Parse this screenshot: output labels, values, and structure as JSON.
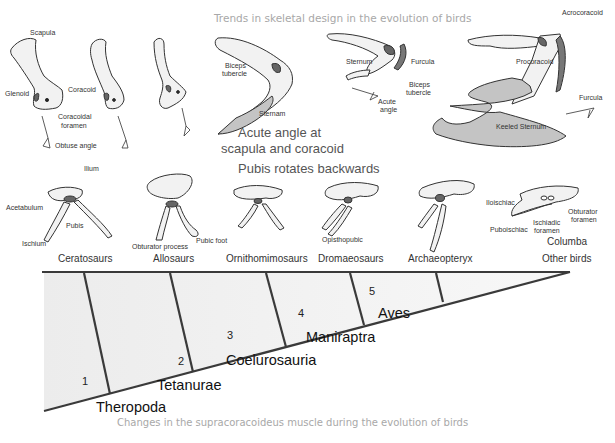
{
  "top_title": "Trends in skeletal design in the evolution of birds",
  "pectoral": {
    "labels": {
      "scapula": "Scapula",
      "glenoid": "Glenoid",
      "coracoid": "Coracoid",
      "coracoidal_foramen_1": "Coracoidal",
      "coracoidal_foramen_2": "foramen",
      "obtuse_angle": "Obtuse angle",
      "biceps_tubercle_1": "Biceps",
      "biceps_tubercle_2": "tubercle",
      "sternam": "Sternam",
      "acute_caption_1": "Acute angle at",
      "acute_caption_2": "scapula and coracoid",
      "sternum": "Sternum",
      "furcula": "Furcula",
      "biceps_tubercle_b1": "Biceps",
      "biceps_tubercle_b2": "tubercle",
      "acute_angle_1": "Acute",
      "acute_angle_2": "angle",
      "acrocoracoid": "Acrocoracoid",
      "procoracoid": "Procoracoid",
      "furcula_2": "Furcula",
      "keeled_sternum": "Keeled Sternum"
    }
  },
  "pelvis": {
    "heading": "Pubis rotates backwards",
    "labels": {
      "ilium": "Ilium",
      "acetabulum": "Acetabulum",
      "pubis": "Pubis",
      "ischium": "Ischium",
      "obturator_process": "Obturator process",
      "pubic_foot": "Pubic foot",
      "opisthopubic": "Opisthopubic",
      "iloischiac": "Iloischiac",
      "puboischiac": "Puboischiac",
      "ischiadic_foramen_1": "Ischiadic",
      "ischiadic_foramen_2": "foramen",
      "obturator_foramen_1": "Obturator",
      "obturator_foramen_2": "foramen",
      "columba": "Columba"
    },
    "taxa": [
      "Ceratosaurs",
      "Allosaurs",
      "Ornithomimosaurs",
      "Dromaeosaurs",
      "Archaeopteryx",
      "Other birds"
    ]
  },
  "cladogram": {
    "nodes": [
      {
        "number": "1",
        "clade": "Theropoda"
      },
      {
        "number": "2",
        "clade": "Tetanurae"
      },
      {
        "number": "3",
        "clade": "Coelurosauria"
      },
      {
        "number": "4",
        "clade": "Maniraptra"
      },
      {
        "number": "5",
        "clade": "Aves"
      }
    ]
  },
  "bottom_title": "Changes in the supracoracoideus muscle during the evolution of birds",
  "colors": {
    "line": "#3a3a3a",
    "bone_fill": "#f2f2f2",
    "dark_fill": "#777777",
    "sternum_fill": "#c4c4c4",
    "triangle_fill": "#f3f3f3",
    "title_gray": "#a8a8a8"
  }
}
